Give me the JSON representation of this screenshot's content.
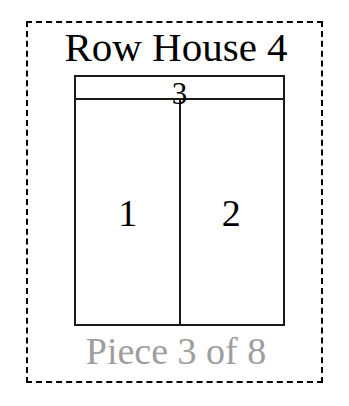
{
  "canvas": {
    "width": 349,
    "height": 406,
    "background_color": "#ffffff"
  },
  "piece_card": {
    "border_style": "dashed",
    "border_color": "#000000"
  },
  "title": "Row House 4",
  "title_color": "#000000",
  "footer": {
    "text": "Piece 3 of 8",
    "color": "#9e9e9e",
    "piece_number": 3,
    "piece_total": 8
  },
  "floorplan": {
    "outline_color": "#1a1a1a",
    "fill_color": "#ffffff",
    "rooms": [
      {
        "id": 3,
        "label": "3",
        "position": "top-band"
      },
      {
        "id": 1,
        "label": "1",
        "position": "lower-left"
      },
      {
        "id": 2,
        "label": "2",
        "position": "lower-right"
      }
    ]
  }
}
